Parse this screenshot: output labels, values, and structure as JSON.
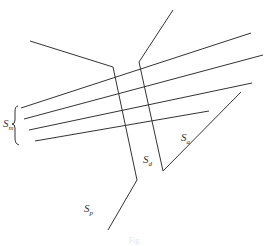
{
  "diagram": {
    "labels": {
      "sm": {
        "main": "S",
        "sub": "m"
      },
      "sd": {
        "main": "S",
        "sub": "d"
      },
      "sa": {
        "main": "S",
        "sub": "a"
      },
      "sp": {
        "main": "S",
        "sub": "p"
      }
    },
    "caption": "Fig."
  },
  "colors": {
    "line": "#333333",
    "background": "#ffffff"
  }
}
